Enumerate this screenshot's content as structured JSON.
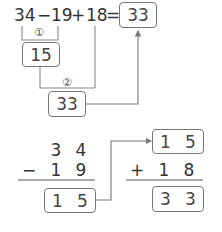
{
  "expression": {
    "terms": [
      "34",
      "−",
      "19",
      "+",
      "18",
      "="
    ],
    "answer": "33"
  },
  "step_labels": [
    "①",
    "②"
  ],
  "intermediate": {
    "step1_result": "15",
    "step2_result": "33"
  },
  "vertical_subtraction": {
    "top": [
      "3",
      "4"
    ],
    "operator": "−",
    "bottom": [
      "1",
      "9"
    ],
    "result": [
      "1",
      "5"
    ]
  },
  "vertical_addition": {
    "top": [
      "1",
      "5"
    ],
    "operator": "+",
    "bottom": [
      "1",
      "8"
    ],
    "result": [
      "3",
      "3"
    ]
  },
  "colors": {
    "line": "#777777",
    "text": "#333333"
  }
}
